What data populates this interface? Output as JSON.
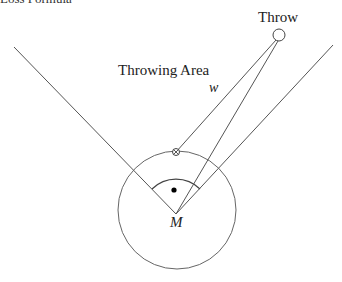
{
  "heading": {
    "text": "Loss Formula"
  },
  "labels": {
    "throw": "Throw",
    "throwing_area": "Throwing Area",
    "w": "w",
    "m": "M"
  },
  "colors": {
    "line": "#555555",
    "text": "#222222",
    "background": "#ffffff"
  },
  "geometry": {
    "vertex_M": [
      176,
      214
    ],
    "big_circle": {
      "cx": 177,
      "cy": 210,
      "r": 59
    },
    "throw_circle": {
      "cx": 279,
      "cy": 35,
      "r": 6
    },
    "marker_x": [
      176,
      152
    ],
    "left_boundary": [
      [
        14,
        47
      ],
      [
        176,
        214
      ]
    ],
    "right_boundary": [
      [
        333,
        45
      ],
      [
        176,
        214
      ]
    ]
  }
}
